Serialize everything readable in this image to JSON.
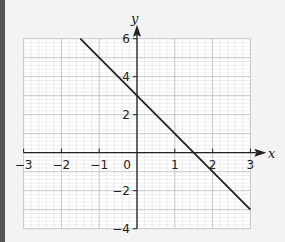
{
  "chart_data": {
    "type": "line",
    "title": "",
    "xlabel": "x",
    "ylabel": "y",
    "xlim": [
      -3,
      3
    ],
    "ylim": [
      -4,
      6
    ],
    "grid": true,
    "x_ticks": [
      "−3",
      "−2",
      "−1",
      "0",
      "1",
      "2",
      "3"
    ],
    "y_ticks": [
      "6",
      "4",
      "2",
      "−2",
      "−4"
    ],
    "origin_label": "0",
    "series": [
      {
        "name": "line",
        "equation": "y = 3 - 2x",
        "x": [
          -1.5,
          3
        ],
        "y": [
          6,
          -3
        ]
      }
    ]
  },
  "colors": {
    "background": "#f3f3f3",
    "left_bar": "#555555",
    "grid_major": "#b9b9b9",
    "grid_minor": "#dcdcdc",
    "axis": "#222222",
    "line": "#222222"
  }
}
